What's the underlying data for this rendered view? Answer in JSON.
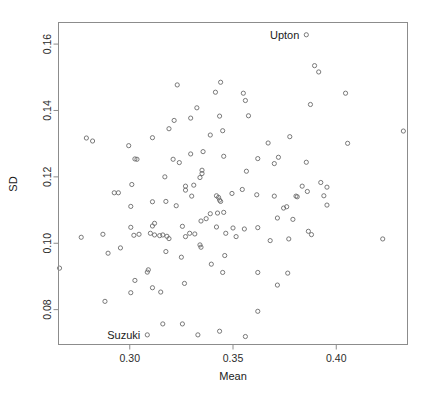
{
  "chart_data": {
    "type": "scatter",
    "title": "",
    "xlabel": "Mean",
    "ylabel": "SD",
    "xlim": [
      0.2655,
      0.4345
    ],
    "ylim": [
      0.0695,
      0.1665
    ],
    "grid": false,
    "legend": null,
    "xticks": [
      0.3,
      0.35,
      0.4
    ],
    "xticklabels": [
      "0.30",
      "0.35",
      "0.40"
    ],
    "yticks": [
      0.08,
      0.1,
      0.12,
      0.14,
      0.16
    ],
    "yticklabels": [
      "0.08",
      "0.10",
      "0.12",
      "0.14",
      "0.16"
    ],
    "marker": "open-circle",
    "marker_color": "#6b6b6b",
    "annotations": [
      {
        "label": "Upton",
        "x": 0.3855,
        "y": 0.1628,
        "text_side": "left"
      },
      {
        "label": "Suzuki",
        "x": 0.3085,
        "y": 0.0724,
        "text_side": "left"
      }
    ],
    "points": [
      [
        0.3855,
        0.1628
      ],
      [
        0.3085,
        0.0724
      ],
      [
        0.3895,
        0.1535
      ],
      [
        0.3915,
        0.1516
      ],
      [
        0.344,
        0.1485
      ],
      [
        0.323,
        0.1477
      ],
      [
        0.3415,
        0.1455
      ],
      [
        0.355,
        0.1452
      ],
      [
        0.4045,
        0.1452
      ],
      [
        0.356,
        0.143
      ],
      [
        0.3875,
        0.1418
      ],
      [
        0.3325,
        0.1408
      ],
      [
        0.3575,
        0.1384
      ],
      [
        0.3435,
        0.1383
      ],
      [
        0.3295,
        0.1377
      ],
      [
        0.3215,
        0.137
      ],
      [
        0.345,
        0.1339
      ],
      [
        0.4325,
        0.1338
      ],
      [
        0.319,
        0.1345
      ],
      [
        0.339,
        0.1326
      ],
      [
        0.3775,
        0.1321
      ],
      [
        0.311,
        0.1318
      ],
      [
        0.279,
        0.1317
      ],
      [
        0.282,
        0.1308
      ],
      [
        0.4055,
        0.1301
      ],
      [
        0.367,
        0.1302
      ],
      [
        0.3355,
        0.1276
      ],
      [
        0.2995,
        0.1294
      ],
      [
        0.3295,
        0.1269
      ],
      [
        0.3455,
        0.1262
      ],
      [
        0.372,
        0.1259
      ],
      [
        0.321,
        0.1253
      ],
      [
        0.3035,
        0.1253
      ],
      [
        0.3025,
        0.1254
      ],
      [
        0.362,
        0.1255
      ],
      [
        0.3855,
        0.1244
      ],
      [
        0.37,
        0.124
      ],
      [
        0.324,
        0.1243
      ],
      [
        0.335,
        0.122
      ],
      [
        0.335,
        0.121
      ],
      [
        0.3565,
        0.1217
      ],
      [
        0.3925,
        0.1183
      ],
      [
        0.317,
        0.12
      ],
      [
        0.334,
        0.1198
      ],
      [
        0.3955,
        0.1169
      ],
      [
        0.3835,
        0.1172
      ],
      [
        0.301,
        0.1177
      ],
      [
        0.327,
        0.1172
      ],
      [
        0.327,
        0.116
      ],
      [
        0.331,
        0.1175
      ],
      [
        0.3545,
        0.1162
      ],
      [
        0.386,
        0.1156
      ],
      [
        0.394,
        0.1143
      ],
      [
        0.2925,
        0.1152
      ],
      [
        0.37,
        0.1142
      ],
      [
        0.3811,
        0.114
      ],
      [
        0.3805,
        0.1142
      ],
      [
        0.2945,
        0.1152
      ],
      [
        0.3495,
        0.115
      ],
      [
        0.342,
        0.1143
      ],
      [
        0.343,
        0.1138
      ],
      [
        0.3615,
        0.1146
      ],
      [
        0.3435,
        0.113
      ],
      [
        0.344,
        0.1126
      ],
      [
        0.33,
        0.1142
      ],
      [
        0.3955,
        0.1115
      ],
      [
        0.3745,
        0.1106
      ],
      [
        0.376,
        0.111
      ],
      [
        0.3005,
        0.1111
      ],
      [
        0.311,
        0.1125
      ],
      [
        0.3175,
        0.1126
      ],
      [
        0.3225,
        0.1113
      ],
      [
        0.3425,
        0.1091
      ],
      [
        0.339,
        0.1089
      ],
      [
        0.3455,
        0.1093
      ],
      [
        0.337,
        0.1074
      ],
      [
        0.312,
        0.106
      ],
      [
        0.3345,
        0.1067
      ],
      [
        0.3255,
        0.1051
      ],
      [
        0.311,
        0.1052
      ],
      [
        0.3005,
        0.1048
      ],
      [
        0.379,
        0.1072
      ],
      [
        0.3715,
        0.1076
      ],
      [
        0.342,
        0.1049
      ],
      [
        0.35,
        0.1046
      ],
      [
        0.362,
        0.1047
      ],
      [
        0.3555,
        0.1043
      ],
      [
        0.3865,
        0.1036
      ],
      [
        0.388,
        0.1026
      ],
      [
        0.3465,
        0.103
      ],
      [
        0.3515,
        0.102
      ],
      [
        0.377,
        0.1013
      ],
      [
        0.368,
        0.1008
      ],
      [
        0.2765,
        0.1018
      ],
      [
        0.287,
        0.1027
      ],
      [
        0.4225,
        0.1013
      ],
      [
        0.3045,
        0.1027
      ],
      [
        0.31,
        0.103
      ],
      [
        0.312,
        0.1025
      ],
      [
        0.3145,
        0.1023
      ],
      [
        0.318,
        0.1021
      ],
      [
        0.3315,
        0.1028
      ],
      [
        0.329,
        0.103
      ],
      [
        0.327,
        0.102
      ],
      [
        0.302,
        0.1024
      ],
      [
        0.316,
        0.1025
      ],
      [
        0.319,
        0.1014
      ],
      [
        0.334,
        0.0995
      ],
      [
        0.3345,
        0.0988
      ],
      [
        0.2955,
        0.0986
      ],
      [
        0.2895,
        0.097
      ],
      [
        0.3175,
        0.0975
      ],
      [
        0.325,
        0.0958
      ],
      [
        0.346,
        0.0963
      ],
      [
        0.3395,
        0.0937
      ],
      [
        0.309,
        0.092
      ],
      [
        0.3085,
        0.0913
      ],
      [
        0.266,
        0.0925
      ],
      [
        0.3025,
        0.0888
      ],
      [
        0.311,
        0.0866
      ],
      [
        0.3005,
        0.0851
      ],
      [
        0.315,
        0.0853
      ],
      [
        0.3265,
        0.0879
      ],
      [
        0.345,
        0.0912
      ],
      [
        0.362,
        0.0912
      ],
      [
        0.3765,
        0.091
      ],
      [
        0.288,
        0.0825
      ],
      [
        0.3715,
        0.0874
      ],
      [
        0.362,
        0.0795
      ],
      [
        0.316,
        0.0757
      ],
      [
        0.3255,
        0.0757
      ],
      [
        0.3435,
        0.0735
      ],
      [
        0.333,
        0.0724
      ],
      [
        0.356,
        0.0719
      ]
    ]
  }
}
